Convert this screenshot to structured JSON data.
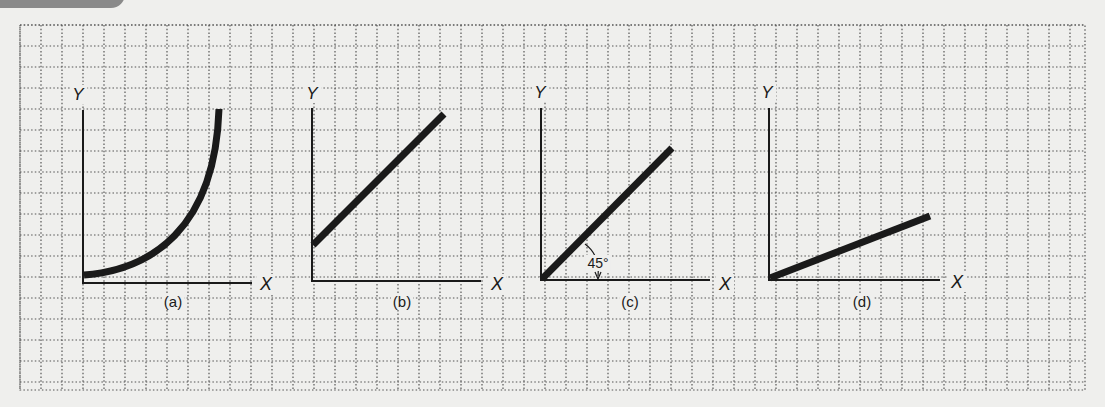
{
  "figure": {
    "header_tag": "",
    "grid": {
      "x0": 20,
      "y0": 25,
      "x1": 1085,
      "y1": 390,
      "cell": 21.0,
      "color": "#555555"
    },
    "panels": [
      {
        "id": "a",
        "caption": "(a)",
        "y_axis_label": "Y",
        "x_axis_label": "X",
        "curve_type": "convex-increasing",
        "description": "Curve rising at an increasing rate (positive, convex relationship)"
      },
      {
        "id": "b",
        "caption": "(b)",
        "y_axis_label": "Y",
        "x_axis_label": "X",
        "curve_type": "linear-positive-intercept",
        "description": "Straight line with positive slope and positive Y-intercept"
      },
      {
        "id": "c",
        "caption": "(c)",
        "y_axis_label": "Y",
        "x_axis_label": "X",
        "curve_type": "linear-45-degree",
        "angle_label": "45°",
        "description": "Straight line from origin at a 45 degree angle"
      },
      {
        "id": "d",
        "caption": "(d)",
        "y_axis_label": "Y",
        "x_axis_label": "X",
        "curve_type": "linear-shallow",
        "description": "Straight line from origin with a shallow positive slope"
      }
    ]
  }
}
